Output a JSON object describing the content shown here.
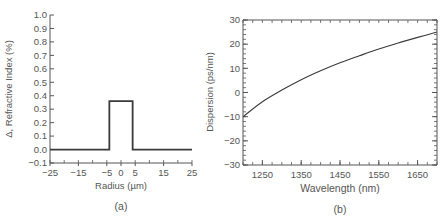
{
  "chart_data": [
    {
      "panel": "(a)",
      "type": "line",
      "title": "",
      "xlabel": "Radius (µm)",
      "ylabel": "Δ, Refractive Index (%)",
      "xlim": [
        -25,
        25
      ],
      "ylim": [
        -0.1,
        1.0
      ],
      "xticks": [
        -25,
        -15,
        -5,
        0,
        5,
        15,
        25
      ],
      "xtick_labels": [
        "−25",
        "−15",
        "−5",
        "0",
        "5",
        "15",
        "25"
      ],
      "yticks": [
        -0.1,
        0.0,
        0.1,
        0.2,
        0.3,
        0.4,
        0.5,
        0.6,
        0.7,
        0.8,
        0.9,
        1.0
      ],
      "ytick_labels": [
        "−0.1",
        "0.0",
        "0.1",
        "0.2",
        "0.3",
        "0.4",
        "0.5",
        "0.6",
        "0.7",
        "0.8",
        "0.9",
        "1.0"
      ],
      "grid": false,
      "series": [
        {
          "name": "step-index profile",
          "x": [
            -25,
            -4.1,
            -4.1,
            4.1,
            4.1,
            25
          ],
          "y": [
            0.0,
            0.0,
            0.36,
            0.36,
            0.0,
            0.0
          ]
        }
      ]
    },
    {
      "panel": "(b)",
      "type": "line",
      "title": "",
      "xlabel": "Wavelength (nm)",
      "ylabel": "Dispersion (ps/nm)",
      "xlim": [
        1200,
        1700
      ],
      "ylim": [
        -30,
        30
      ],
      "xticks": [
        1250,
        1350,
        1450,
        1550,
        1650
      ],
      "xtick_labels": [
        "1250",
        "1350",
        "1450",
        "1550",
        "1650"
      ],
      "yticks": [
        -30,
        -20,
        -10,
        0,
        10,
        20,
        30
      ],
      "ytick_labels": [
        "−30",
        "−20",
        "−10",
        "0",
        "10",
        "20",
        "30"
      ],
      "grid": false,
      "series": [
        {
          "name": "dispersion",
          "x": [
            1200,
            1250,
            1300,
            1350,
            1400,
            1450,
            1500,
            1550,
            1600,
            1650,
            1700
          ],
          "y": [
            -10,
            -3.8,
            1.0,
            5.3,
            9.0,
            12.3,
            15.2,
            18.0,
            20.5,
            22.8,
            25.0
          ]
        }
      ]
    }
  ]
}
